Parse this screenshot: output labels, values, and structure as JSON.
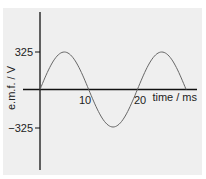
{
  "chart_data": {
    "type": "line",
    "title": "",
    "xlabel": "time / ms",
    "ylabel": "e.m.f. / V",
    "x_ticks": [
      "10",
      "20"
    ],
    "y_ticks": [
      "325",
      "-325"
    ],
    "xlim": [
      0,
      30
    ],
    "ylim": [
      -325,
      325
    ],
    "grid": false,
    "series": [
      {
        "name": "e.m.f.",
        "function": "325*sin(2*pi*t/20)",
        "x": [
          0,
          5,
          10,
          15,
          20,
          25,
          30
        ],
        "values": [
          0,
          325,
          0,
          -325,
          0,
          325,
          0
        ]
      }
    ],
    "colors": {
      "curve": "#555555",
      "axes": "#111111",
      "background": "#efefef"
    }
  },
  "labels": {
    "y_axis": "e.m.f. / V",
    "x_axis": "time / ms",
    "tick_pos": "325",
    "tick_neg": "−325",
    "tick_10": "10",
    "tick_20": "20"
  }
}
